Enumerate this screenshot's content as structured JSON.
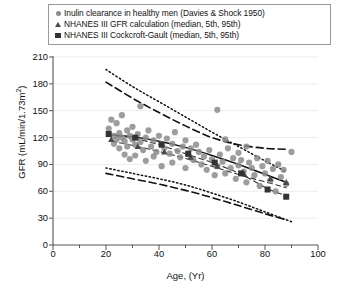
{
  "legend": {
    "position": "top",
    "items": [
      {
        "marker": "circle-marker",
        "color": "#8c8c8c",
        "label": "Inulin clearance in healthy men (Davies & Shock 1950)"
      },
      {
        "marker": "triangle-marker",
        "color": "#4a4a4a",
        "label": "NHANES III GFR calculation (median, 5th, 95th)"
      },
      {
        "marker": "square-marker",
        "color": "#333333",
        "label": "NHANES III Cockcroft-Gault (median, 5th, 95th)"
      }
    ]
  },
  "axes": {
    "xlabel": "Age, (Yr)",
    "ylabel_text": "GFR (mL/min/1.73m",
    "ylabel_sup": "2",
    "ylabel_close": ")",
    "xticks": [
      "0",
      "20",
      "40",
      "60",
      "80",
      "100"
    ],
    "yticks": [
      "0",
      "30",
      "60",
      "90",
      "120",
      "150",
      "180",
      "210"
    ]
  },
  "chart_data": {
    "type": "scatter",
    "title": "",
    "xlabel": "Age, (Yr)",
    "ylabel": "GFR (mL/min/1.73m2)",
    "xlim": [
      0,
      100
    ],
    "ylim": [
      0,
      210
    ],
    "xticks": [
      0,
      20,
      40,
      60,
      80,
      100
    ],
    "xminor_ticks": [
      10,
      30,
      50,
      70,
      90
    ],
    "yticks": [
      0,
      30,
      60,
      90,
      120,
      150,
      180,
      210
    ],
    "grid": "horizontal-only-faint",
    "series": [
      {
        "name": "Inulin clearance in healthy men (Davies & Shock 1950)",
        "type": "scatter",
        "marker": "circle",
        "color": "#8c8c8c",
        "points": [
          [
            21,
            130
          ],
          [
            22,
            140
          ],
          [
            23,
            122
          ],
          [
            23,
            113
          ],
          [
            24,
            136
          ],
          [
            24,
            118
          ],
          [
            25,
            125
          ],
          [
            25,
            108
          ],
          [
            26,
            145
          ],
          [
            26,
            120
          ],
          [
            27,
            116
          ],
          [
            27,
            101
          ],
          [
            28,
            128
          ],
          [
            28,
            110
          ],
          [
            29,
            122
          ],
          [
            29,
            96
          ],
          [
            30,
            132
          ],
          [
            30,
            118
          ],
          [
            31,
            112
          ],
          [
            31,
            100
          ],
          [
            32,
            124
          ],
          [
            33,
            155
          ],
          [
            33,
            115
          ],
          [
            34,
            106
          ],
          [
            35,
            120
          ],
          [
            35,
            94
          ],
          [
            36,
            128
          ],
          [
            37,
            110
          ],
          [
            38,
            117
          ],
          [
            38,
            99
          ],
          [
            39,
            104
          ],
          [
            40,
            122
          ],
          [
            41,
            113
          ],
          [
            41,
            88
          ],
          [
            42,
            108
          ],
          [
            43,
            119
          ],
          [
            44,
            102
          ],
          [
            45,
            113
          ],
          [
            45,
            92
          ],
          [
            46,
            126
          ],
          [
            47,
            105
          ],
          [
            48,
            98
          ],
          [
            49,
            110
          ],
          [
            50,
            117
          ],
          [
            50,
            86
          ],
          [
            51,
            101
          ],
          [
            52,
            108
          ],
          [
            53,
            95
          ],
          [
            54,
            112
          ],
          [
            55,
            104
          ],
          [
            56,
            90
          ],
          [
            57,
            99
          ],
          [
            58,
            84
          ],
          [
            59,
            106
          ],
          [
            60,
            96
          ],
          [
            61,
            78
          ],
          [
            62,
            151
          ],
          [
            62,
            88
          ],
          [
            63,
            101
          ],
          [
            64,
            93
          ],
          [
            65,
            118
          ],
          [
            65,
            80
          ],
          [
            66,
            108
          ],
          [
            67,
            86
          ],
          [
            68,
            97
          ],
          [
            69,
            74
          ],
          [
            70,
            103
          ],
          [
            70,
            89
          ],
          [
            71,
            95
          ],
          [
            72,
            82
          ],
          [
            73,
            110
          ],
          [
            73,
            70
          ],
          [
            74,
            92
          ],
          [
            75,
            86
          ],
          [
            76,
            78
          ],
          [
            77,
            97
          ],
          [
            78,
            66
          ],
          [
            79,
            88
          ],
          [
            80,
            80
          ],
          [
            81,
            94
          ],
          [
            82,
            72
          ],
          [
            83,
            85
          ],
          [
            84,
            60
          ],
          [
            85,
            90
          ],
          [
            86,
            76
          ],
          [
            87,
            84
          ],
          [
            88,
            68
          ],
          [
            90,
            104
          ]
        ]
      },
      {
        "name": "NHANES III GFR calculation (median, 5th, 95th)",
        "type": "marker+line",
        "marker": "triangle",
        "color": "#4a4a4a",
        "median_points": [
          [
            22,
            118
          ],
          [
            32,
            110
          ],
          [
            42,
            104
          ],
          [
            52,
            98
          ],
          [
            62,
            88
          ],
          [
            72,
            80
          ],
          [
            82,
            74
          ],
          [
            88,
            70
          ]
        ]
      },
      {
        "name": "NHANES III Cockcroft-Gault (median, 5th, 95th)",
        "type": "marker+line",
        "marker": "square",
        "color": "#333333",
        "median_points": [
          [
            21,
            124
          ],
          [
            31,
            120
          ],
          [
            41,
            112
          ],
          [
            51,
            102
          ],
          [
            61,
            92
          ],
          [
            71,
            80
          ],
          [
            81,
            62
          ],
          [
            88,
            54
          ]
        ]
      }
    ],
    "curves": [
      {
        "name": "inulin-regression-median",
        "style": "solid",
        "color": "#111111",
        "points": [
          [
            22,
            123
          ],
          [
            30,
            121
          ],
          [
            40,
            116
          ],
          [
            50,
            109
          ],
          [
            60,
            100
          ],
          [
            70,
            90
          ],
          [
            80,
            79
          ],
          [
            88,
            70
          ]
        ]
      },
      {
        "name": "cockcroft-gault-95th",
        "style": "dotted",
        "color": "#111111",
        "points": [
          [
            20,
            196
          ],
          [
            30,
            177
          ],
          [
            40,
            160
          ],
          [
            50,
            143
          ],
          [
            60,
            126
          ],
          [
            70,
            110
          ],
          [
            80,
            94
          ],
          [
            88,
            82
          ]
        ]
      },
      {
        "name": "gfr-calc-95th",
        "style": "dashed",
        "color": "#111111",
        "points": [
          [
            20,
            182
          ],
          [
            30,
            164
          ],
          [
            40,
            148
          ],
          [
            50,
            133
          ],
          [
            60,
            120
          ],
          [
            70,
            112
          ],
          [
            80,
            108
          ],
          [
            88,
            107
          ]
        ]
      },
      {
        "name": "gfr-calc-5th",
        "style": "dashed",
        "color": "#111111",
        "points": [
          [
            20,
            80
          ],
          [
            30,
            74
          ],
          [
            40,
            68
          ],
          [
            50,
            61
          ],
          [
            60,
            53
          ],
          [
            70,
            44
          ],
          [
            80,
            35
          ],
          [
            88,
            28
          ]
        ]
      },
      {
        "name": "cockcroft-gault-5th",
        "style": "dotted",
        "color": "#111111",
        "points": [
          [
            20,
            86
          ],
          [
            30,
            80
          ],
          [
            40,
            74
          ],
          [
            50,
            67
          ],
          [
            60,
            58
          ],
          [
            70,
            48
          ],
          [
            80,
            37
          ],
          [
            90,
            26
          ]
        ]
      },
      {
        "name": "gfr-calc-median-trend",
        "style": "dashed-thin",
        "color": "#333333",
        "points": [
          [
            22,
            116
          ],
          [
            32,
            110
          ],
          [
            42,
            103
          ],
          [
            52,
            95
          ],
          [
            62,
            86
          ],
          [
            72,
            77
          ],
          [
            82,
            69
          ],
          [
            88,
            64
          ]
        ]
      },
      {
        "name": "cockcroft-gault-median-trend",
        "style": "dashed-thin",
        "color": "#333333",
        "points": [
          [
            21,
            123
          ],
          [
            31,
            119
          ],
          [
            41,
            111
          ],
          [
            51,
            101
          ],
          [
            61,
            91
          ],
          [
            71,
            79
          ],
          [
            81,
            63
          ],
          [
            88,
            55
          ]
        ]
      }
    ]
  }
}
